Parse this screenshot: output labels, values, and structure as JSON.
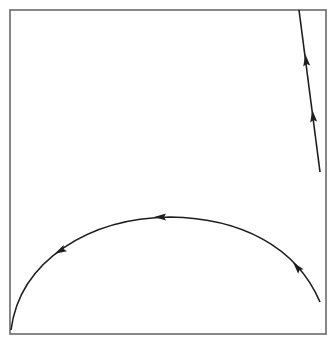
{
  "diagram": {
    "type": "phase-trajectory",
    "frame": {
      "x": 10,
      "y": 10,
      "width": 316,
      "height": 324,
      "stroke": "#6a6a6a"
    },
    "stroke_color": "#1e1e1e",
    "trajectories": [
      {
        "id": "steep-line",
        "description": "Near-vertical trajectory in upper right, direction upward",
        "path": "M 320 172 L 299 10",
        "arrows": [
          {
            "x": 306,
            "y": 60,
            "angle": -97
          },
          {
            "x": 313,
            "y": 116,
            "angle": -97
          }
        ]
      },
      {
        "id": "arc",
        "description": "Arc trajectory from lower right rising to peak and descending to lower left, direction leftward",
        "path": "M 320 302 C 296 246, 240 218, 170 217 C 90 218, 20 260, 11 330",
        "arrows": [
          {
            "x": 297,
            "y": 267,
            "angle": -130
          },
          {
            "x": 160,
            "y": 217,
            "angle": 180
          },
          {
            "x": 60,
            "y": 251,
            "angle": 152
          }
        ]
      }
    ]
  }
}
